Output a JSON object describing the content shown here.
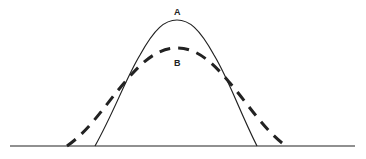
{
  "diagram": {
    "type": "distribution-curves-comparison",
    "curves": [
      {
        "id": "A",
        "label": "A",
        "style": "solid",
        "peak": {
          "x": 177,
          "y": 20
        },
        "start_x": 95,
        "end_x": 257
      },
      {
        "id": "B",
        "label": "B",
        "style": "dashed",
        "peak": {
          "x": 177,
          "y": 48
        },
        "start_x": 67,
        "end_x": 286
      }
    ],
    "baseline": {
      "x1": 10,
      "x2": 355,
      "y": 146
    },
    "colors": {
      "stroke": "#222222",
      "background": "#ffffff"
    }
  }
}
